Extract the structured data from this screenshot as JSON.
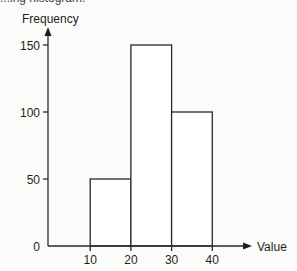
{
  "caption_fragment": "...ing histogram.",
  "chart_data": {
    "type": "bar",
    "title": "",
    "xlabel": "Value",
    "ylabel": "Frequency",
    "bins": [
      {
        "start": 10,
        "end": 20,
        "value": 50
      },
      {
        "start": 20,
        "end": 30,
        "value": 150
      },
      {
        "start": 30,
        "end": 40,
        "value": 100
      }
    ],
    "categories": [
      "10-20",
      "20-30",
      "30-40"
    ],
    "values": [
      50,
      150,
      100
    ],
    "x_ticks": [
      10,
      20,
      30,
      40
    ],
    "y_ticks": [
      0,
      50,
      100,
      150
    ],
    "xlim": [
      0,
      50
    ],
    "ylim": [
      0,
      160
    ],
    "grid": false,
    "legend": null
  },
  "colors": {
    "line": "#2a2a2a",
    "bar_fill": "#ffffff",
    "background": "#fbfbfa"
  }
}
